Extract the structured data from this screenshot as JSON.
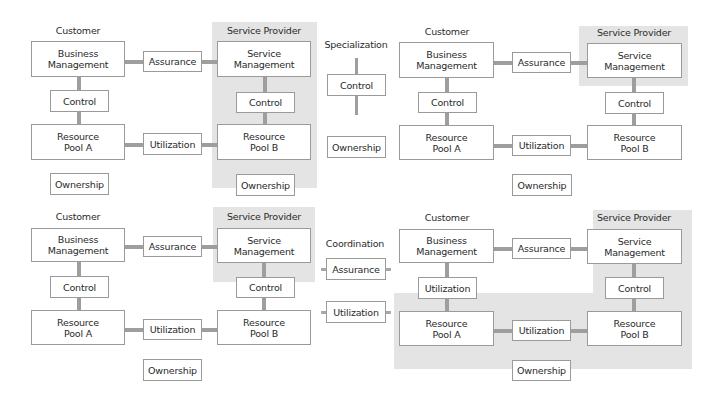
{
  "diagram": {
    "colors": {
      "provider_shading": "#e4e4e4",
      "connector": "#9e9e9e",
      "box_border": "#9a9a9a"
    },
    "panel_top_left": {
      "customer_label": "Customer",
      "provider_label": "Service Provider",
      "business_management": "Business Management",
      "service_management": "Service Management",
      "assurance": "Assurance",
      "control_customer": "Control",
      "control_provider": "Control",
      "resource_pool_a": "Resource Pool A",
      "resource_pool_b": "Resource Pool B",
      "utilization": "Utilization",
      "ownership_customer": "Ownership",
      "ownership_provider": "Ownership"
    },
    "panel_specialization": {
      "title": "Specialization",
      "control": "Control",
      "ownership": "Ownership"
    },
    "panel_top_right": {
      "customer_label": "Customer",
      "provider_label": "Service Provider",
      "business_management": "Business Management",
      "service_management": "Service Management",
      "assurance": "Assurance",
      "control_customer": "Control",
      "control_provider": "Control",
      "resource_pool_a": "Resource Pool A",
      "resource_pool_b": "Resource Pool B",
      "utilization": "Utilization",
      "ownership": "Ownership"
    },
    "panel_bottom_left": {
      "customer_label": "Customer",
      "provider_label": "Service Provider",
      "business_management": "Business Management",
      "service_management": "Service Management",
      "assurance": "Assurance",
      "control_customer": "Control",
      "control_provider": "Control",
      "resource_pool_a": "Resource Pool A",
      "resource_pool_b": "Resource Pool B",
      "utilization": "Utilization",
      "ownership": "Ownership"
    },
    "panel_coordination": {
      "title": "Coordination",
      "assurance": "Assurance",
      "utilization": "Utilization"
    },
    "panel_bottom_right": {
      "customer_label": "Customer",
      "provider_label": "Service Provider",
      "business_management": "Business Management",
      "service_management": "Service Management",
      "assurance": "Assurance",
      "utilization_customer": "Utilization",
      "control_provider": "Control",
      "resource_pool_a": "Resource Pool A",
      "resource_pool_b": "Resource Pool B",
      "utilization": "Utilization",
      "ownership": "Ownership"
    }
  }
}
